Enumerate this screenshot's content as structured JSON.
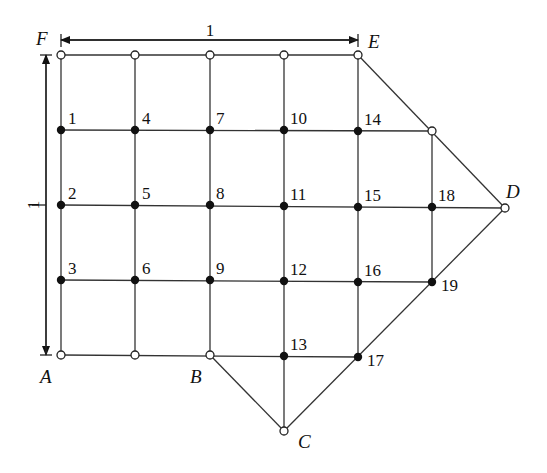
{
  "diagram": {
    "type": "grid-mesh",
    "dimensions": {
      "horizontal_label": "1",
      "vertical_label": "1"
    },
    "corner_labels": {
      "A": "A",
      "B": "B",
      "C": "C",
      "D": "D",
      "E": "E",
      "F": "F"
    },
    "corner_points": {
      "F": [
        61,
        55
      ],
      "E": [
        358,
        55
      ],
      "D": [
        505,
        208
      ],
      "C": [
        284,
        431
      ],
      "B": [
        210,
        355
      ],
      "A": [
        61,
        355
      ]
    },
    "boundary_open_nodes": [
      [
        61,
        55
      ],
      [
        135,
        55
      ],
      [
        210,
        55
      ],
      [
        284,
        55
      ],
      [
        358,
        55
      ],
      [
        432,
        131
      ],
      [
        505,
        208
      ],
      [
        284,
        431
      ],
      [
        61,
        355
      ],
      [
        135,
        355
      ],
      [
        210,
        355
      ]
    ],
    "interior_nodes": [
      {
        "id": "1",
        "x": 61,
        "y": 130
      },
      {
        "id": "2",
        "x": 61,
        "y": 205
      },
      {
        "id": "3",
        "x": 61,
        "y": 280
      },
      {
        "id": "4",
        "x": 135,
        "y": 130
      },
      {
        "id": "5",
        "x": 135,
        "y": 205
      },
      {
        "id": "6",
        "x": 135,
        "y": 280
      },
      {
        "id": "7",
        "x": 210,
        "y": 130
      },
      {
        "id": "8",
        "x": 210,
        "y": 205
      },
      {
        "id": "9",
        "x": 210,
        "y": 280
      },
      {
        "id": "10",
        "x": 284,
        "y": 130
      },
      {
        "id": "11",
        "x": 284,
        "y": 206
      },
      {
        "id": "12",
        "x": 284,
        "y": 281
      },
      {
        "id": "13",
        "x": 284,
        "y": 356
      },
      {
        "id": "14",
        "x": 358,
        "y": 131
      },
      {
        "id": "15",
        "x": 358,
        "y": 207
      },
      {
        "id": "16",
        "x": 358,
        "y": 282
      },
      {
        "id": "17",
        "x": 358,
        "y": 357
      },
      {
        "id": "18",
        "x": 432,
        "y": 207
      },
      {
        "id": "19",
        "x": 432,
        "y": 282
      }
    ]
  }
}
